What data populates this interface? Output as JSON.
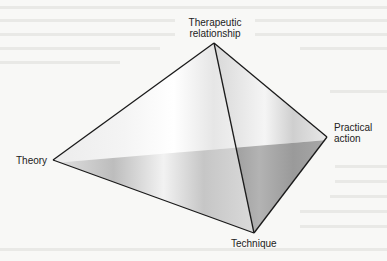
{
  "diagram": {
    "type": "pyramid",
    "vertices": {
      "top": {
        "label_line1": "Therapeutic",
        "label_line2": "relationship"
      },
      "right": {
        "label_line1": "Practical",
        "label_line2": "action"
      },
      "left": {
        "label": "Theory"
      },
      "bottom": {
        "label": "Technique"
      }
    },
    "colors": {
      "edge": "#1a1a1a",
      "face_light": "#ffffff",
      "face_mid": "#c8c8c8",
      "face_dark": "#8c8c8c",
      "background": "#f8f8f6",
      "text": "#222222"
    }
  }
}
